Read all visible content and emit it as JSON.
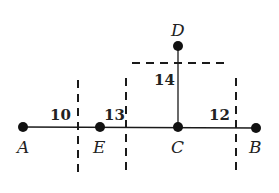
{
  "points": {
    "A": {
      "label": "A",
      "x": 23,
      "y": 127
    },
    "E": {
      "label": "E",
      "x": 100,
      "y": 127
    },
    "C": {
      "label": "C",
      "x": 178,
      "y": 127
    },
    "B": {
      "label": "B",
      "x": 256,
      "y": 128
    },
    "D": {
      "label": "D",
      "x": 178,
      "y": 46
    }
  },
  "distances": {
    "AE": "10",
    "EC": "13",
    "CD": "14",
    "CB": "12"
  },
  "colors": {
    "ink": "#1a1a1a",
    "background": "#ffffff"
  }
}
